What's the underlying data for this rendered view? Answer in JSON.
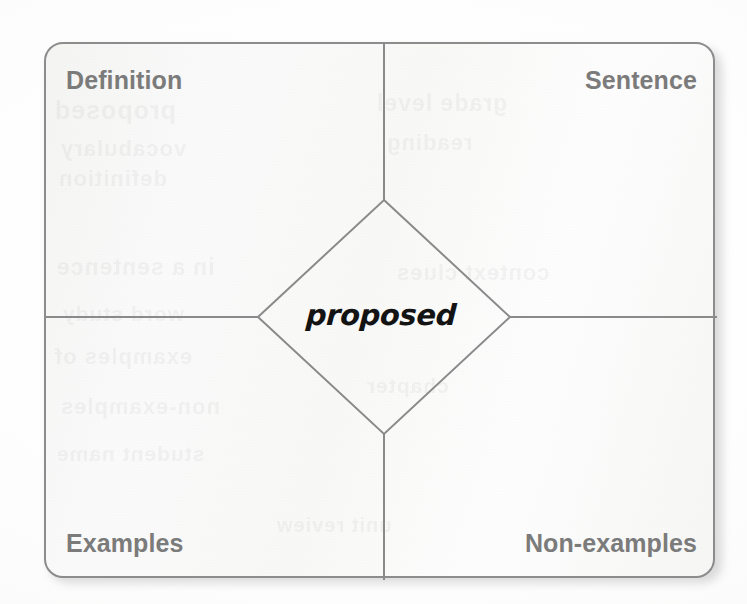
{
  "worksheet": {
    "type": "frayer-model",
    "center_term": "proposed",
    "quadrants": [
      {
        "key": "definition",
        "label": "Definition",
        "position": "top-left",
        "content": ""
      },
      {
        "key": "sentence",
        "label": "Sentence",
        "position": "top-right",
        "content": ""
      },
      {
        "key": "examples",
        "label": "Examples",
        "position": "bottom-left",
        "content": ""
      },
      {
        "key": "non_examples",
        "label": "Non-examples",
        "position": "bottom-right",
        "content": ""
      }
    ]
  },
  "colors": {
    "page_background": "#ffffff",
    "card_background": "#f8f8f7",
    "card_border": "#8c8c8c",
    "divider_line": "#8a8a8a",
    "diamond_line": "#8a8a8a",
    "label_text": "#7b7b7b",
    "center_term_text": "#131313",
    "shadow": "#bdbdbd"
  },
  "geometry": {
    "card": {
      "x": 44,
      "y": 42,
      "width": 671,
      "height": 536,
      "corner_radius": 19
    },
    "vertical_divider_x": 338,
    "horizontal_divider_y": 273,
    "diamond": {
      "center_x": 338,
      "center_y": 273,
      "half_width": 126,
      "half_height": 117
    }
  },
  "ghost_bleed": {
    "note": "faint reverse-side text bleed-through from scanned paper",
    "fragments": [
      "proposed",
      "vocabulary",
      "definition",
      "in a sentence",
      "word study",
      "examples of",
      "non-examples",
      "student name",
      "grade level",
      "reading",
      "context clues",
      "chapter",
      "unit review"
    ]
  }
}
